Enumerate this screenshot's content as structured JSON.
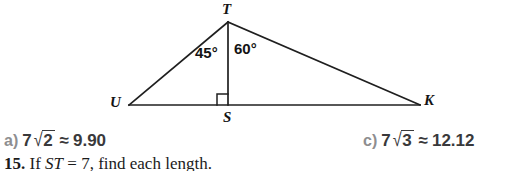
{
  "figure": {
    "name": "right-triangle-altitude-diagram",
    "stroke_color": "#1f1f1f",
    "vertices": [
      {
        "id": "T",
        "label": "T",
        "x": 228,
        "y": 22,
        "label_x": 222,
        "label_y": 3
      },
      {
        "id": "U",
        "label": "U",
        "x": 129,
        "y": 105,
        "label_x": 110,
        "label_y": 95
      },
      {
        "id": "S",
        "label": "S",
        "x": 228,
        "y": 105,
        "label_x": 223,
        "label_y": 110
      },
      {
        "id": "K",
        "label": "K",
        "x": 420,
        "y": 105,
        "label_x": 424,
        "label_y": 94
      }
    ],
    "segments": [
      {
        "name": "segment-TU",
        "from": "T",
        "to": "U"
      },
      {
        "name": "segment-TK",
        "from": "T",
        "to": "K"
      },
      {
        "name": "segment-UK",
        "from": "U",
        "to": "K"
      },
      {
        "name": "segment-TS-altitude",
        "from": "T",
        "to": "S"
      }
    ],
    "right_angle": {
      "name": "right-angle-mark-at-S",
      "at": "S",
      "size": 11,
      "side": "left"
    },
    "angles": [
      {
        "name": "angle-UTS",
        "label": "45°",
        "x": 195,
        "y": 45
      },
      {
        "name": "angle-STK",
        "label": "60°",
        "x": 234,
        "y": 41
      }
    ]
  },
  "choices": [
    {
      "id": "a",
      "tag": "a)",
      "coefficient": "7",
      "radicand": "2",
      "approx_symbol": "≈",
      "value": "9.90",
      "x": 4,
      "y": 130
    },
    {
      "id": "c",
      "tag": "c)",
      "coefficient": "7",
      "radicand": "3",
      "approx_symbol": "≈",
      "value": "12.12",
      "x": 363,
      "y": 130
    }
  ],
  "problem": {
    "number": "15.",
    "text_before": "If",
    "variable": "ST",
    "text_after": "= 7, find each length.",
    "x": 4,
    "y": 155
  }
}
